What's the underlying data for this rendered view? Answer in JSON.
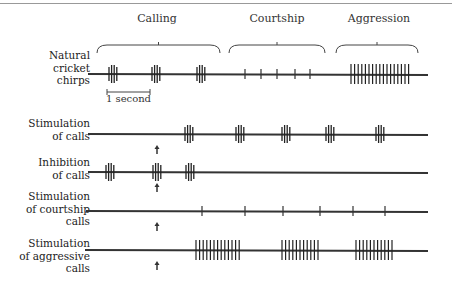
{
  "categories": [
    {
      "label": "Calling",
      "x": 157,
      "y": 24,
      "bracket": [
        97,
        220
      ]
    },
    {
      "label": "Courtship",
      "x": 277,
      "y": 24,
      "bracket": [
        229,
        325
      ]
    },
    {
      "label": "Aggression",
      "x": 379,
      "y": 24,
      "bracket": [
        336,
        418
      ]
    }
  ],
  "scale_bar": {
    "label": "1 second",
    "x1": 107,
    "x2": 150,
    "y": 92
  },
  "rows": [
    {
      "label_lines": [
        "Natural",
        "cricket",
        "chirps"
      ],
      "label_top": 49,
      "baseline": 74,
      "chirps": [
        {
          "x": 113,
          "type": "chirp"
        },
        {
          "x": 156,
          "type": "chirp"
        },
        {
          "x": 201,
          "type": "chirp"
        }
      ],
      "ticks": [
        245,
        261,
        277,
        295,
        310
      ],
      "aggression": [
        {
          "x1": 351,
          "x2": 410
        }
      ],
      "line": [
        88,
        428
      ],
      "arrow": null
    },
    {
      "label_lines": [
        "Stimulation",
        "of calls"
      ],
      "label_top": 117,
      "baseline": 134,
      "chirps": [
        {
          "x": 189
        },
        {
          "x": 240
        },
        {
          "x": 286
        },
        {
          "x": 330
        },
        {
          "x": 380
        }
      ],
      "ticks": [],
      "aggression": [],
      "line": [
        88,
        428
      ],
      "arrow": 157
    },
    {
      "label_lines": [
        "Inhibition",
        "of calls"
      ],
      "label_top": 156,
      "baseline": 172,
      "chirps": [
        {
          "x": 110
        },
        {
          "x": 157
        },
        {
          "x": 190
        }
      ],
      "ticks": [],
      "aggression": [],
      "line": [
        88,
        428
      ],
      "arrow": 157
    },
    {
      "label_lines": [
        "Stimulation",
        "of courtship",
        "calls"
      ],
      "label_top": 190,
      "baseline": 211,
      "chirps": [],
      "ticks": [
        202,
        245,
        283,
        320,
        353,
        385
      ],
      "aggression": [],
      "line": [
        86,
        428
      ],
      "arrow": 157
    },
    {
      "label_lines": [
        "Stimulation",
        "of aggressive",
        "calls"
      ],
      "label_top": 237,
      "baseline": 250,
      "chirps": [],
      "ticks": [],
      "aggression": [
        {
          "x1": 196,
          "x2": 242
        },
        {
          "x1": 282,
          "x2": 320
        },
        {
          "x1": 356,
          "x2": 393
        }
      ],
      "line": [
        85,
        428
      ],
      "arrow": 157
    }
  ]
}
